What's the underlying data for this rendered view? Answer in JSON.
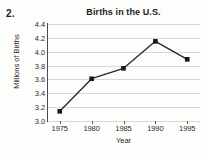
{
  "problem": {
    "number": "2."
  },
  "chart_data": {
    "type": "line",
    "title": "Births in the U.S.",
    "xlabel": "Year",
    "ylabel": "Millions of Births",
    "categories": [
      "1975",
      "1980",
      "1985",
      "1990",
      "1995"
    ],
    "x": [
      1975,
      1980,
      1985,
      1990,
      1995
    ],
    "values": [
      3.14,
      3.61,
      3.76,
      4.15,
      3.89
    ],
    "series": [
      {
        "name": "Births",
        "values": [
          3.14,
          3.61,
          3.76,
          4.15,
          3.89
        ]
      }
    ],
    "xlim": [
      1973,
      1997
    ],
    "ylim": [
      3.0,
      4.4
    ],
    "ytick_labels": [
      "4.4",
      "4.2",
      "4.0",
      "3.8",
      "3.6",
      "3.4",
      "3.2",
      "3.0"
    ],
    "ytick_values": [
      4.4,
      4.2,
      4.0,
      3.8,
      3.6,
      3.4,
      3.2,
      3.0
    ],
    "xtick_labels": [
      "1975",
      "1980",
      "1985",
      "1990",
      "1995"
    ],
    "grid": "horizontal",
    "legend": "none",
    "marker": "square",
    "colors": {
      "line": "#262626",
      "marker": "#171717",
      "grid": "#d8d8d4",
      "axis": "#4a4a4a",
      "background": "#fdfdfb",
      "text": "#1b1b1b"
    }
  }
}
